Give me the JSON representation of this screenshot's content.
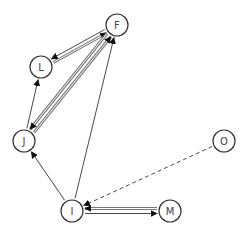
{
  "diagram": {
    "type": "directed-graph",
    "nodes": [
      {
        "id": "F",
        "label": "F",
        "x": 117,
        "y": 25
      },
      {
        "id": "L",
        "label": "L",
        "x": 41,
        "y": 67
      },
      {
        "id": "J",
        "label": "J",
        "x": 24,
        "y": 141
      },
      {
        "id": "O",
        "label": "O",
        "x": 224,
        "y": 141
      },
      {
        "id": "I",
        "label": "I",
        "x": 72,
        "y": 211
      },
      {
        "id": "M",
        "label": "M",
        "x": 170,
        "y": 211
      }
    ],
    "edges": [
      {
        "from": "L",
        "to": "F",
        "style": "double",
        "offset": 2
      },
      {
        "from": "F",
        "to": "L",
        "style": "thin",
        "offset": 2
      },
      {
        "from": "J",
        "to": "F",
        "style": "double",
        "offset": 2.5
      },
      {
        "from": "F",
        "to": "J",
        "style": "double",
        "offset": 2.5
      },
      {
        "from": "J",
        "to": "L",
        "style": "thin",
        "offset": 0
      },
      {
        "from": "I",
        "to": "J",
        "style": "thin",
        "offset": 0
      },
      {
        "from": "I",
        "to": "F",
        "style": "thin",
        "offset": 0
      },
      {
        "from": "O",
        "to": "I",
        "style": "dashed",
        "offset": 0
      },
      {
        "from": "M",
        "to": "I",
        "style": "double",
        "offset": 2.5
      },
      {
        "from": "I",
        "to": "M",
        "style": "thin",
        "offset": 2.5
      }
    ],
    "colors": {
      "node_stroke": "#333333",
      "edge_thin": "#333333",
      "edge_double": "#777777",
      "label": "#444444"
    },
    "node_radius": 11
  }
}
